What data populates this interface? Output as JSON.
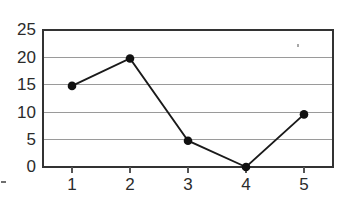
{
  "chart_data": {
    "type": "line",
    "title": "",
    "subtitle": "",
    "xlabel": "",
    "ylabel": "",
    "x": [
      1,
      2,
      3,
      4,
      5
    ],
    "values": [
      14.8,
      19.8,
      4.8,
      0,
      9.6
    ],
    "series": [
      {
        "name": "series-1",
        "x": [
          1,
          2,
          3,
          4,
          5
        ],
        "values": [
          14.8,
          19.8,
          4.8,
          0,
          9.6
        ]
      }
    ],
    "xlim": [
      0.5,
      5.5
    ],
    "ylim": [
      0,
      25
    ],
    "y_ticks": [
      0,
      5,
      10,
      15,
      20,
      25
    ],
    "x_ticks": [
      1,
      2,
      3,
      4,
      5
    ],
    "y_tick_labels": [
      "0",
      "5",
      "10",
      "15",
      "20",
      "25"
    ],
    "x_tick_labels": [
      "1",
      "2",
      "3",
      "4",
      "5"
    ],
    "grid": true,
    "grid_axis": "y",
    "legend": false,
    "legend_position": "none",
    "marker": "circle",
    "annotations": []
  },
  "axes": {
    "y_labels": [
      {
        "text": "25",
        "value": 25
      },
      {
        "text": "20",
        "value": 20
      },
      {
        "text": "15",
        "value": 15
      },
      {
        "text": "10",
        "value": 10
      },
      {
        "text": "5",
        "value": 5
      },
      {
        "text": "0",
        "value": 0
      }
    ],
    "x_labels": [
      {
        "text": "1",
        "value": 1
      },
      {
        "text": "2",
        "value": 2
      },
      {
        "text": "3",
        "value": 3
      },
      {
        "text": "4",
        "value": 4
      },
      {
        "text": "5",
        "value": 5
      }
    ]
  },
  "colors": {
    "background": "#ffffff",
    "frame": "#333333",
    "gridline": "#9a9a9a",
    "series_line": "#1a1a1a",
    "marker_fill": "#111111",
    "tick_label": "#2b2b2b",
    "tick_mark": "#555555",
    "artifact": "#a8a8a8"
  },
  "geometry": {
    "plot_left": 43,
    "plot_right": 333,
    "plot_top": 30,
    "plot_bottom": 167
  }
}
